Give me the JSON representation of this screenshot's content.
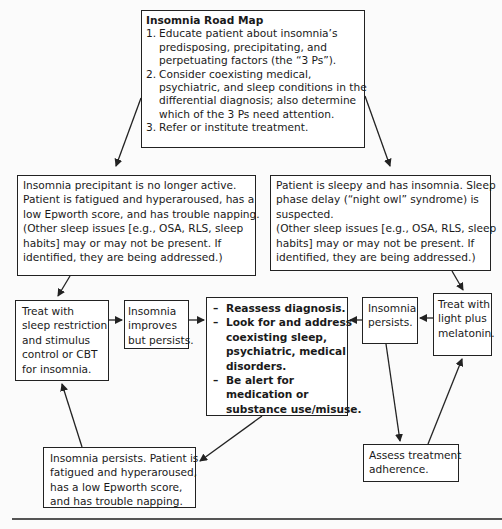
{
  "title": "Insomnia Road Map",
  "roadmap": {
    "heading": "Insomnia Road Map",
    "steps": [
      {
        "num": "1.",
        "text": "Educate patient about insomnia’s\npredisposing, precipitating, and\nperpetuating factors (the “3 Ps”)."
      },
      {
        "num": "2.",
        "text": "Consider coexisting medical,\npsychiatric, and sleep conditions in the\ndifferential diagnosis; also determine\nwhich of the 3 Ps need attention."
      },
      {
        "num": "3.",
        "text": "Refer or institute treatment."
      }
    ]
  },
  "left_branch": {
    "condition": "Insomnia precipitant is no longer active.\nPatient is fatigued and hyperaroused, has a\nlow Epworth score, and has trouble napping.\n(Other sleep issues [e.g., OSA, RLS, sleep\nhabits] may or may not be present. If\nidentified, they are being addressed.)",
    "treatment": "Treat with\nsleep restriction\nand stimulus\ncontrol or CBT\nfor insomnia.",
    "outcome_improves": "Insomnia\nimproves\nbut persists.",
    "outcome_persists": "Insomnia persists. Patient is\nfatigued and hyperaroused,\nhas a low Epworth score,\nand has trouble napping."
  },
  "right_branch": {
    "condition": "Patient is sleepy and has insomnia. Sleep\nphase delay (“night owl” syndrome) is\nsuspected.\n(Other sleep issues [e.g., OSA, RLS, sleep\nhabits] may or may not be present. If\nidentified, they are being addressed.)",
    "treatment": "Treat with\nlight plus\nmelatonin.",
    "outcome_persists": "Insomnia\npersists.",
    "adherence": "Assess treatment\nadherence."
  },
  "reassess": {
    "dash": "–",
    "items": [
      "Reassess diagnosis.",
      "Look for and address\ncoexisting sleep,\npsychiatric, medical\ndisorders.",
      "Be alert for\nmedication or\nsubstance use/misuse."
    ]
  },
  "colors": {
    "line": "#222222",
    "background": "#fbfbfb",
    "box_fill": "#ffffff"
  }
}
